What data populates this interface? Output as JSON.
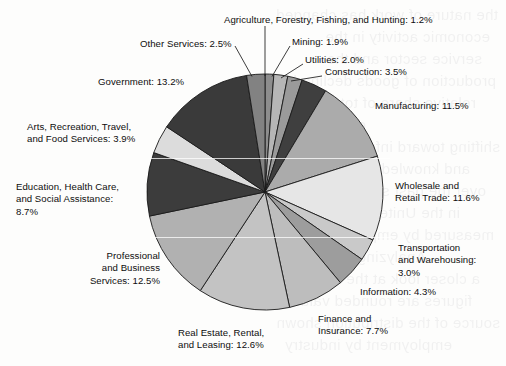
{
  "chart_data": {
    "type": "pie",
    "title": "",
    "subtitle": "",
    "xlabel": "",
    "ylabel": "",
    "legend_position": "none",
    "grid": false,
    "units": "percent",
    "total": 100.1,
    "start_angle_deg": -90,
    "direction": "clockwise",
    "categories": [
      "Agriculture, Forestry, Fishing, and Hunting",
      "Mining",
      "Utilities",
      "Construction",
      "Manufacturing",
      "Wholesale and Retail Trade",
      "Transportation and Warehousing",
      "Information",
      "Finance and Insurance",
      "Real Estate, Rental, and Leasing",
      "Professional and Business Services",
      "Education, Health Care, and Social Assistance",
      "Arts, Recreation, Travel, and Food Services",
      "Government",
      "Other Services"
    ],
    "values": [
      1.2,
      1.9,
      2.0,
      3.5,
      11.5,
      11.6,
      3.0,
      4.3,
      7.7,
      12.6,
      12.5,
      8.7,
      3.9,
      13.2,
      2.5
    ],
    "slice_colors": [
      "#8d8d8d",
      "#b6b6b6",
      "#9a9a9a",
      "#3f3f3f",
      "#ababab",
      "#e6e6e6",
      "#c9c9c9",
      "#9d9d9d",
      "#bdbdbd",
      "#c3c3c3",
      "#b1b1b1",
      "#3c3c3c",
      "#dcdcdc",
      "#3a3a3a",
      "#828282"
    ],
    "slice_stroke": "#1a1a1a",
    "background": "#fdfdfc"
  },
  "labels": [
    {
      "id": "agriculture",
      "lines": [
        "Agriculture, Forestry, Fishing, and Hunting: 1.2%"
      ],
      "value": "1.2%"
    },
    {
      "id": "mining",
      "lines": [
        "Mining: 1.9%"
      ],
      "value": "1.9%"
    },
    {
      "id": "utilities",
      "lines": [
        "Utilities: 2.0%"
      ],
      "value": "2.0%"
    },
    {
      "id": "construction",
      "lines": [
        "Construction: 3.5%"
      ],
      "value": "3.5%"
    },
    {
      "id": "manufacturing",
      "lines": [
        "Manufacturing: 11.5%"
      ],
      "value": "11.5%"
    },
    {
      "id": "wholesale",
      "lines": [
        "Wholesale and",
        "Retail Trade: 11.6%"
      ],
      "value": "11.6%"
    },
    {
      "id": "transportation",
      "lines": [
        "Transportation",
        "and Warehousing:",
        "3.0%"
      ],
      "value": "3.0%"
    },
    {
      "id": "information",
      "lines": [
        "Information: 4.3%"
      ],
      "value": "4.3%"
    },
    {
      "id": "finance",
      "lines": [
        "Finance and",
        "Insurance: 7.7%"
      ],
      "value": "7.7%"
    },
    {
      "id": "realestate",
      "lines": [
        "Real Estate, Rental,",
        "and Leasing: 12.6%"
      ],
      "value": "12.6%"
    },
    {
      "id": "professional",
      "lines": [
        "Professional",
        "and Business",
        "Services: 12.5%"
      ],
      "value": "12.5%"
    },
    {
      "id": "education",
      "lines": [
        "Education, Health Care,",
        "and Social Assistance:",
        "8.7%"
      ],
      "value": "8.7%"
    },
    {
      "id": "arts",
      "lines": [
        "Arts, Recreation, Travel,",
        "and Food Services: 3.9%"
      ],
      "value": "3.9%"
    },
    {
      "id": "government",
      "lines": [
        "Government: 13.2%"
      ],
      "value": "13.2%"
    },
    {
      "id": "otherservices",
      "lines": [
        "Other Services: 2.5%"
      ],
      "value": "2.5%"
    }
  ],
  "label_text": {
    "agriculture_l0": "Agriculture, Forestry, Fishing, and Hunting: 1.2%",
    "mining_l0": "Mining: 1.9%",
    "utilities_l0": "Utilities: 2.0%",
    "construction_l0": "Construction: 3.5%",
    "manufacturing_l0": "Manufacturing: 11.5%",
    "wholesale_l0": "Wholesale and",
    "wholesale_l1": "Retail Trade: 11.6%",
    "transportation_l0": "Transportation",
    "transportation_l1": "and Warehousing:",
    "transportation_l2": "3.0%",
    "information_l0": "Information: 4.3%",
    "finance_l0": "Finance and",
    "finance_l1": "Insurance: 7.7%",
    "realestate_l0": "Real Estate, Rental,",
    "realestate_l1": "and Leasing: 12.6%",
    "professional_l0": "Professional",
    "professional_l1": "and Business",
    "professional_l2": "Services: 12.5%",
    "education_l0": "Education, Health Care,",
    "education_l1": "and Social Assistance:",
    "education_l2": "8.7%",
    "arts_l0": "Arts, Recreation, Travel,",
    "arts_l1": "and Food Services: 3.9%",
    "government_l0": "Government: 13.2%",
    "otherservices_l0": "Other Services: 2.5%"
  }
}
